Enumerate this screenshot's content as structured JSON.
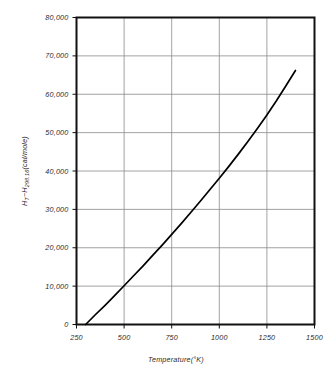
{
  "chart_data": {
    "type": "line",
    "title": "",
    "subtitle": "",
    "xlabel": "Temperature (°K)",
    "ylabel": "H_T − H_298.16 (cal/mole)",
    "ylabel_parts": {
      "h1": "H",
      "h1_sub": "T",
      "minus": "−",
      "h2": "H",
      "h2_sub": "298.16",
      "units": "(cal/mole)"
    },
    "xlabel_parts": {
      "name": "Temperature",
      "units": "(°K)"
    },
    "xlim": [
      250,
      1500
    ],
    "ylim": [
      0,
      80000
    ],
    "grid": true,
    "legend": null,
    "x_ticks": [
      250,
      500,
      750,
      1000,
      1250,
      1500
    ],
    "x_tick_labels": [
      "250",
      "500",
      "750",
      "1000",
      "1250",
      "1500"
    ],
    "y_ticks": [
      0,
      10000,
      20000,
      30000,
      40000,
      50000,
      60000,
      70000,
      80000
    ],
    "y_tick_labels": [
      "0",
      "10,000",
      "20,000",
      "30,000",
      "40,000",
      "50,000",
      "60,000",
      "70,000",
      "80,000"
    ],
    "series": [
      {
        "name": "enthalpy-curve",
        "color": "#000000",
        "x": [
          298,
          350,
          400,
          450,
          500,
          550,
          600,
          650,
          700,
          750,
          800,
          850,
          900,
          950,
          1000,
          1050,
          1100,
          1150,
          1200,
          1250,
          1300,
          1350,
          1400
        ],
        "y": [
          0,
          2600,
          5000,
          7500,
          10100,
          12700,
          15300,
          18000,
          20700,
          23500,
          26300,
          29200,
          32100,
          35100,
          38100,
          41200,
          44400,
          47700,
          51100,
          54600,
          58300,
          62200,
          66200
        ]
      }
    ]
  },
  "colors": {
    "axis": "#111111",
    "grid": "#8a8a8a",
    "curve": "#000000",
    "background": "#ffffff",
    "text": "#2b2b2b"
  }
}
